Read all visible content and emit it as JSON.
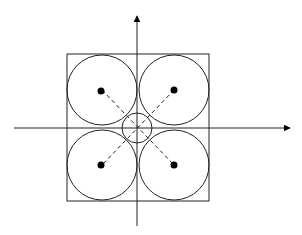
{
  "diagram": {
    "colors": {
      "stroke": "#222222",
      "background": "#ffffff",
      "dot": "#000000"
    },
    "axes": {
      "origin": [
        137,
        128
      ],
      "x_axis": {
        "from": [
          14,
          128
        ],
        "to": [
          290,
          128
        ]
      },
      "y_axis": {
        "from": [
          137,
          226
        ],
        "to": [
          137,
          16
        ]
      }
    },
    "square": {
      "x": 67,
      "y": 54,
      "width": 142,
      "height": 147
    },
    "large_circles": [
      {
        "cx": 102,
        "cy": 90,
        "r": 35
      },
      {
        "cx": 174,
        "cy": 90,
        "r": 35
      },
      {
        "cx": 102,
        "cy": 165,
        "r": 35
      },
      {
        "cx": 174,
        "cy": 165,
        "r": 35
      }
    ],
    "center_circle": {
      "cx": 137,
      "cy": 128,
      "r": 15
    },
    "center_dots_radius": 3.5
  }
}
